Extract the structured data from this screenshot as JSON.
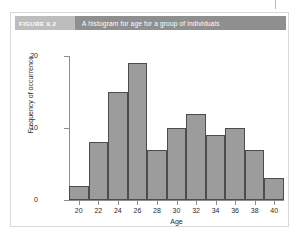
{
  "figure": {
    "number_label": "FIGURE 9.2",
    "title": "A histogram for age for a group of individuals"
  },
  "chart_data": {
    "type": "bar",
    "title": "A histogram for age for a group of individuals",
    "xlabel": "Age",
    "ylabel": "Frequency of occurrence",
    "categories": [
      "20",
      "22",
      "24",
      "26",
      "28",
      "30",
      "32",
      "34",
      "36",
      "38",
      "40"
    ],
    "values": [
      2,
      8,
      15,
      19,
      7,
      10,
      12,
      9,
      10,
      7,
      3
    ],
    "xlim": [
      19,
      41
    ],
    "ylim": [
      0,
      20
    ],
    "y_ticks": [
      "0",
      "10",
      "20"
    ],
    "x_ticks": [
      "20",
      "22",
      "24",
      "26",
      "28",
      "30",
      "32",
      "34",
      "36",
      "38",
      "40"
    ],
    "grid": false,
    "legend": false,
    "bar_color": "#9c9c9c",
    "bar_border_color": "#4c4c4c",
    "axis_color": "#8d8d8d"
  }
}
